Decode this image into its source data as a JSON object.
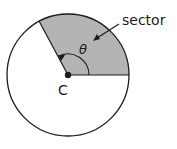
{
  "diagram": {
    "labels": {
      "sector": "sector",
      "angle": "θ",
      "center": "C"
    },
    "colors": {
      "sector_fill": "#b4b4b4",
      "stroke": "#1a1a1a",
      "background": "#ffffff"
    }
  }
}
